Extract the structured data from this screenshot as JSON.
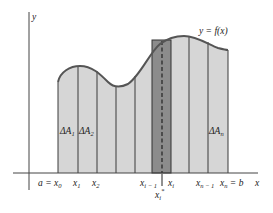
{
  "figure": {
    "type": "riemann-sum-diagram",
    "axes": {
      "x_label": "x",
      "y_label": "y"
    },
    "curve_label": "y = f(x)",
    "colors": {
      "strip_fill": "#d6d6d6",
      "highlight_fill": "#8c8c8c",
      "stroke": "#3a3a3a",
      "curve": "#555555"
    },
    "area_labels": {
      "first": {
        "base": "ΔA",
        "sub": "1"
      },
      "second": {
        "base": "ΔA",
        "sub": "2"
      },
      "last": {
        "base": "ΔA",
        "sub": "n"
      }
    },
    "x_ticks": [
      {
        "text": "a = x",
        "sub": "0"
      },
      {
        "text": "x",
        "sub": "1"
      },
      {
        "text": "x",
        "sub": "2"
      },
      {
        "text": "x",
        "sub": "i − 1"
      },
      {
        "text": "x",
        "sub": "i"
      },
      {
        "text": "x",
        "sub": "n − 1"
      },
      {
        "text": "x",
        "sub": "n",
        "suffix": " = b"
      }
    ],
    "sample_point": {
      "text": "x",
      "sub": "i",
      "sup": "*"
    }
  }
}
